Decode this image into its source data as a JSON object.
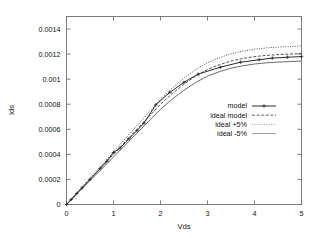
{
  "chart_data": {
    "type": "line",
    "title": "",
    "xlabel": "Vds",
    "ylabel": "Ids",
    "xlim": [
      0,
      5
    ],
    "ylim": [
      0,
      0.0015
    ],
    "grid": false,
    "legend_position": "center-right",
    "xticks": [
      "0",
      "1",
      "2",
      "3",
      "4",
      "5"
    ],
    "xtick_values": [
      0,
      1,
      2,
      3,
      4,
      5
    ],
    "yticks": [
      "0",
      "0.0002",
      "0.0004",
      "0.0006",
      "0.0008",
      "0.001",
      "0.0012",
      "0.0014"
    ],
    "ytick_values": [
      0,
      0.0002,
      0.0004,
      0.0006,
      0.0008,
      0.001,
      0.0012,
      0.0014
    ],
    "series": [
      {
        "name": "model",
        "style": "solid-with-plus-markers",
        "color": "#2b2b2b",
        "x": [
          0.0,
          0.1,
          0.22,
          0.33,
          0.5,
          0.72,
          0.86,
          1.0,
          1.14,
          1.33,
          1.5,
          1.65,
          1.9,
          2.2,
          2.5,
          2.8,
          3.27,
          3.7,
          4.1,
          4.38,
          4.7,
          5.0
        ],
        "y": [
          0.0,
          4e-05,
          8.8e-05,
          0.000132,
          0.0002,
          0.00029,
          0.000345,
          0.000415,
          0.00045,
          0.000525,
          0.00059,
          0.00065,
          0.000795,
          0.000895,
          0.000975,
          0.00104,
          0.001095,
          0.001135,
          0.001155,
          0.001168,
          0.001175,
          0.00118
        ]
      },
      {
        "name": "ideal model",
        "style": "dashed",
        "color": "#3a3a3a",
        "x": [
          0.0,
          0.25,
          0.5,
          0.75,
          1.0,
          1.25,
          1.5,
          1.75,
          2.0,
          2.25,
          2.5,
          2.75,
          3.0,
          3.25,
          3.5,
          3.75,
          4.0,
          4.25,
          4.5,
          4.75,
          5.0
        ],
        "y": [
          0.0,
          0.000102,
          0.000201,
          0.000298,
          0.0004,
          0.0005,
          0.0006,
          0.0007,
          0.0008,
          0.000885,
          0.00096,
          0.001025,
          0.001078,
          0.001115,
          0.001145,
          0.001165,
          0.00118,
          0.00119,
          0.001196,
          0.0012,
          0.001205
        ]
      },
      {
        "name": "ideal +5%",
        "style": "dotted",
        "color": "#8a8a8a",
        "x": [
          0.0,
          0.25,
          0.5,
          0.75,
          1.0,
          1.25,
          1.5,
          1.75,
          2.0,
          2.25,
          2.5,
          2.75,
          3.0,
          3.25,
          3.5,
          3.75,
          4.0,
          4.25,
          4.5,
          4.75,
          5.0
        ],
        "y": [
          0.0,
          0.0001071,
          0.000211,
          0.0003129,
          0.00042,
          0.000525,
          0.00063,
          0.000735,
          0.00084,
          0.0009292,
          0.001008,
          0.0010762,
          0.0011319,
          0.0011707,
          0.0012022,
          0.0012232,
          0.001239,
          0.0012495,
          0.0012558,
          0.00126,
          0.0012652
        ]
      },
      {
        "name": "ideal -5%",
        "style": "thin-solid",
        "color": "#707070",
        "x": [
          0.0,
          0.25,
          0.5,
          0.75,
          1.0,
          1.25,
          1.5,
          1.75,
          2.0,
          2.25,
          2.5,
          2.75,
          3.0,
          3.25,
          3.5,
          3.75,
          4.0,
          4.25,
          4.5,
          4.75,
          5.0
        ],
        "y": [
          0.0,
          9.69e-05,
          0.000191,
          0.0002831,
          0.00038,
          0.000475,
          0.00057,
          0.000665,
          0.00076,
          0.0008408,
          0.000912,
          0.0009738,
          0.0010241,
          0.0010592,
          0.0010878,
          0.0011068,
          0.001121,
          0.0011305,
          0.0011362,
          0.00114,
          0.0011448
        ]
      }
    ],
    "legend": [
      {
        "label": "model",
        "style": "solid-with-plus-markers"
      },
      {
        "label": "ideal model",
        "style": "dashed"
      },
      {
        "label": "ideal +5%",
        "style": "dotted"
      },
      {
        "label": "ideal -5%",
        "style": "thin-solid"
      }
    ]
  }
}
